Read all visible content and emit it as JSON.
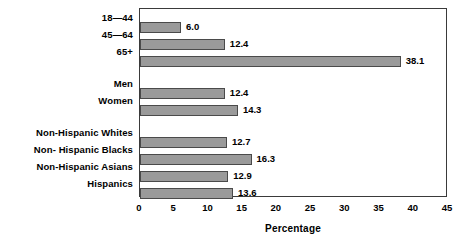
{
  "chart_data": {
    "type": "bar",
    "orientation": "horizontal",
    "title": "",
    "subtitle": "",
    "xlabel": "Percentage",
    "ylabel": "",
    "xlim": [
      0,
      45
    ],
    "xticks": [
      0,
      5,
      10,
      15,
      20,
      25,
      30,
      35,
      40,
      45
    ],
    "xtick_labels": [
      "0",
      "5",
      "10",
      "15",
      "20",
      "25",
      "30",
      "35",
      "40",
      "45"
    ],
    "grid": false,
    "legend": null,
    "bar_color": "#9a9a9a",
    "bar_border_color": "#4a4a4a",
    "frame_color": "#3a3a3a",
    "categories": [
      "18—44",
      "45—64",
      "65+",
      "Men",
      "Women",
      "Non-Hispanic Whites",
      "Non- Hispanic Blacks",
      "Non-Hispanic Asians",
      "Hispanics"
    ],
    "values": [
      6.0,
      12.4,
      38.1,
      12.4,
      14.3,
      12.7,
      16.3,
      12.9,
      13.6
    ],
    "value_labels": [
      "6.0",
      "12.4",
      "38.1",
      "12.4",
      "14.3",
      "12.7",
      "16.3",
      "12.9",
      "13.6"
    ],
    "groups": [
      {
        "name": "Age",
        "categories": [
          "18—44",
          "45—64",
          "65+"
        ]
      },
      {
        "name": "Sex",
        "categories": [
          "Men",
          "Women"
        ]
      },
      {
        "name": "Race/Ethnicity",
        "categories": [
          "Non-Hispanic Whites",
          "Non- Hispanic Blacks",
          "Non-Hispanic Asians",
          "Hispanics"
        ]
      }
    ],
    "bars": [
      {
        "label": "18—44",
        "value": 6.0,
        "value_label": "6.0",
        "top": 13,
        "height": 11
      },
      {
        "label": "45—64",
        "value": 12.4,
        "value_label": "12.4",
        "top": 30,
        "height": 11
      },
      {
        "label": "65+",
        "value": 38.1,
        "value_label": "38.1",
        "top": 47,
        "height": 11
      },
      {
        "label": "Men",
        "value": 12.4,
        "value_label": "12.4",
        "top": 79,
        "height": 11
      },
      {
        "label": "Women",
        "value": 14.3,
        "value_label": "14.3",
        "top": 96,
        "height": 11
      },
      {
        "label": "Non-Hispanic Whites",
        "value": 12.7,
        "value_label": "12.7",
        "top": 128,
        "height": 11
      },
      {
        "label": "Non- Hispanic Blacks",
        "value": 16.3,
        "value_label": "16.3",
        "top": 145,
        "height": 11
      },
      {
        "label": "Non-Hispanic Asians",
        "value": 12.9,
        "value_label": "12.9",
        "top": 162,
        "height": 11
      },
      {
        "label": "Hispanics",
        "value": 13.6,
        "value_label": "13.6",
        "top": 179,
        "height": 11
      }
    ]
  }
}
